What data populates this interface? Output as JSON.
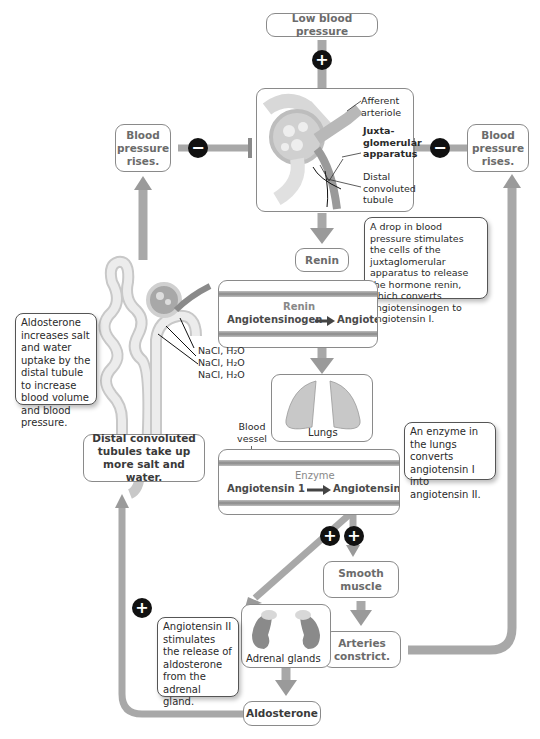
{
  "nodes": {
    "low_bp": "Low blood pressure",
    "bp_rises_left": "Blood pressure rises.",
    "bp_rises_right": "Blood pressure rises.",
    "renin": "Renin",
    "smooth_muscle": "Smooth muscle",
    "arteries_constrict": "Arteries constrict.",
    "aldosterone": "Aldosterone",
    "distal_tubules": "Distal convoluted tubules take up more salt and water."
  },
  "kidney_panel": {
    "afferent": "Afferent arteriole",
    "juxta": "Juxta-glomerular apparatus",
    "distal": "Distal convoluted tubule"
  },
  "renin_panel": {
    "enzyme": "Renin",
    "substrate": "Angiotensinogen",
    "product": "Angiotensin I"
  },
  "lungs_panel": {
    "label": "Lungs",
    "blood_vessel": "Blood vessel"
  },
  "enzyme_panel": {
    "enzyme": "Enzyme",
    "substrate": "Angiotensin 1",
    "product": "Angiotensin II"
  },
  "adrenal_panel": {
    "label": "Adrenal glands"
  },
  "nephron": {
    "nacl": [
      "NaCl, H₂O",
      "NaCl, H₂O",
      "NaCl, H₂O"
    ]
  },
  "notes": {
    "renin_note": "A drop in blood pressure stimulates the cells of the juxtaglomerular apparatus to release the hormone renin, which converts angiotensinogen to angiotensin I.",
    "enzyme_note": "An enzyme in the lungs converts angiotensin I into angiotensin II.",
    "aldo_note": "Aldosterone increases salt and water uptake by the distal tubule to increase blood volume and blood pressure.",
    "angio_note": "Angiotensin II stimulates the release of aldosterone from the adrenal gland."
  },
  "badges": {
    "plus": "+",
    "minus": "−"
  },
  "colors": {
    "arrow": "#a8a8a8",
    "badge": "#111111",
    "border": "#8a8a8a"
  }
}
